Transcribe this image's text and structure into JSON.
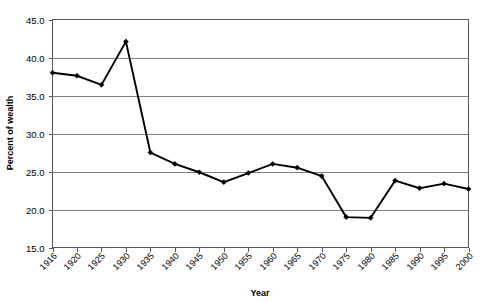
{
  "chart_data": {
    "type": "line",
    "title": "",
    "xlabel": "Year",
    "ylabel": "Percent of wealth",
    "categories": [
      "1916",
      "1920",
      "1925",
      "1930",
      "1935",
      "1940",
      "1945",
      "1950",
      "1955",
      "1960",
      "1965",
      "1970",
      "1975",
      "1980",
      "1985",
      "1990",
      "1995",
      "2000"
    ],
    "x": [
      1916,
      1920,
      1925,
      1930,
      1935,
      1940,
      1945,
      1950,
      1955,
      1960,
      1965,
      1970,
      1975,
      1980,
      1985,
      1990,
      1995,
      2000
    ],
    "values": [
      38.0,
      37.6,
      36.4,
      42.1,
      27.5,
      26.0,
      24.9,
      23.6,
      24.8,
      26.0,
      25.5,
      24.4,
      19.0,
      18.9,
      23.8,
      22.8,
      23.4,
      22.7
    ],
    "series": [
      {
        "name": "Percent of wealth",
        "values": [
          38.0,
          37.6,
          36.4,
          42.1,
          27.5,
          26.0,
          24.9,
          23.6,
          24.8,
          26.0,
          25.5,
          24.4,
          19.0,
          18.9,
          23.8,
          22.8,
          23.4,
          22.7
        ]
      }
    ],
    "ylim": [
      15.0,
      45.0
    ],
    "yticks": [
      15.0,
      20.0,
      25.0,
      30.0,
      35.0,
      40.0,
      45.0
    ],
    "ytick_labels": [
      "15.0",
      "20.0",
      "25.0",
      "30.0",
      "35.0",
      "40.0",
      "45.0"
    ],
    "xtick_labels": [
      "1916",
      "1920",
      "1925",
      "1930",
      "1935",
      "1940",
      "1945",
      "1950",
      "1955",
      "1960",
      "1965",
      "1970",
      "1975",
      "1980",
      "1985",
      "1990",
      "1995",
      "2000"
    ],
    "grid": true,
    "grid_axis": "y",
    "legend": false,
    "legend_position": "none",
    "marker": "diamond",
    "line_color": "#000000",
    "grid_color": "#808080",
    "frame_color": "#595959",
    "background": "#ffffff"
  },
  "axes": {
    "y_label": "Percent of wealth",
    "x_label": "Year",
    "y_ticks": [
      "45.0",
      "40.0",
      "35.0",
      "30.0",
      "25.0",
      "20.0",
      "15.0"
    ],
    "x_ticks": [
      "1916",
      "1920",
      "1925",
      "1930",
      "1935",
      "1940",
      "1945",
      "1950",
      "1955",
      "1960",
      "1965",
      "1970",
      "1975",
      "1980",
      "1985",
      "1990",
      "1995",
      "2000"
    ]
  }
}
